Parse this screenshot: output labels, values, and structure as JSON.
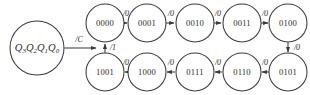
{
  "diagram": {
    "type": "finite-state-machine-state-diagram",
    "canvas": {
      "width": 310,
      "height": 95,
      "background": "#ffffff"
    },
    "stroke_color": "#3a3a3a",
    "text_color": "#2b2b2b",
    "register": {
      "label_plain": "Q3Q2Q1Q0",
      "parts": [
        {
          "base": "Q",
          "sub": "3"
        },
        {
          "base": "Q",
          "sub": "2"
        },
        {
          "base": "Q",
          "sub": "1"
        },
        {
          "base": "Q",
          "sub": "0"
        }
      ],
      "cx": 37,
      "cy": 48,
      "r": 27
    },
    "nodes": [
      {
        "id": "s0000",
        "label": "0000",
        "cx": 105,
        "cy": 23,
        "r": 19
      },
      {
        "id": "s0001",
        "label": "0001",
        "cx": 147,
        "cy": 23,
        "r": 19
      },
      {
        "id": "s0010",
        "label": "0010",
        "cx": 195,
        "cy": 23,
        "r": 19
      },
      {
        "id": "s0011",
        "label": "0011",
        "cx": 242,
        "cy": 23,
        "r": 19
      },
      {
        "id": "s0100",
        "label": "0100",
        "cx": 288,
        "cy": 23,
        "r": 19
      },
      {
        "id": "s0101",
        "label": "0101",
        "cx": 288,
        "cy": 72,
        "r": 19
      },
      {
        "id": "s0110",
        "label": "0110",
        "cx": 242,
        "cy": 72,
        "r": 19
      },
      {
        "id": "s0111",
        "label": "0111",
        "cx": 195,
        "cy": 72,
        "r": 19
      },
      {
        "id": "s1000",
        "label": "1000",
        "cx": 147,
        "cy": 72,
        "r": 19
      },
      {
        "id": "s1001",
        "label": "1001",
        "cx": 105,
        "cy": 72,
        "r": 19
      }
    ],
    "edges": [
      {
        "id": "e-entry",
        "from": "register",
        "to": "s0000-junction",
        "label": "/C",
        "label_x": 79,
        "label_y": 40
      },
      {
        "id": "e-0000-0001",
        "from": "s0000",
        "to": "s0001",
        "label": "/0",
        "label_x": 126,
        "label_y": 15
      },
      {
        "id": "e-0001-0010",
        "from": "s0001",
        "to": "s0010",
        "label": "/0",
        "label_x": 171,
        "label_y": 15
      },
      {
        "id": "e-0010-0011",
        "from": "s0010",
        "to": "s0011",
        "label": "/0",
        "label_x": 218,
        "label_y": 15
      },
      {
        "id": "e-0011-0100",
        "from": "s0011",
        "to": "s0100",
        "label": "/0",
        "label_x": 265,
        "label_y": 15
      },
      {
        "id": "e-0100-0101",
        "from": "s0100",
        "to": "s0101",
        "label": "/0",
        "label_x": 297,
        "label_y": 48
      },
      {
        "id": "e-0101-0110",
        "from": "s0101",
        "to": "s0110",
        "label": "/0",
        "label_x": 265,
        "label_y": 64
      },
      {
        "id": "e-0110-0111",
        "from": "s0110",
        "to": "s0111",
        "label": "/0",
        "label_x": 218,
        "label_y": 64
      },
      {
        "id": "e-0111-1000",
        "from": "s0111",
        "to": "s1000",
        "label": "/0",
        "label_x": 171,
        "label_y": 64
      },
      {
        "id": "e-1000-1001",
        "from": "s1000",
        "to": "s1001",
        "label": "/0",
        "label_x": 126,
        "label_y": 64
      },
      {
        "id": "e-1001-0000",
        "from": "s1001",
        "to": "s0000",
        "label": "/1",
        "label_x": 113,
        "label_y": 48
      }
    ]
  }
}
